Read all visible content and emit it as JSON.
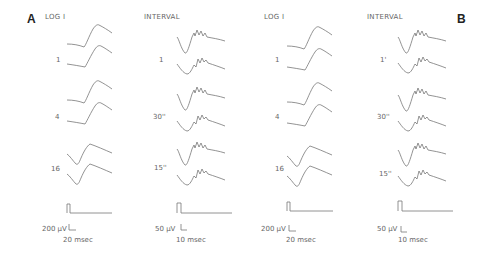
{
  "figure": {
    "panels": [
      {
        "id": "A",
        "letter": "A",
        "columns": [
          {
            "header": "LOG I",
            "rows": [
              {
                "label": "1"
              },
              {
                "label": "4"
              },
              {
                "label": "16"
              }
            ],
            "scale": {
              "amplitude": "200 µV",
              "time": "20 msec"
            }
          },
          {
            "header": "INTERVAL",
            "rows": [
              {
                "label": "1"
              },
              {
                "label": "30''"
              },
              {
                "label": "15''"
              }
            ],
            "scale": {
              "amplitude": "50 µV",
              "time": "10 msec"
            }
          }
        ]
      },
      {
        "id": "B",
        "letter": "B",
        "columns": [
          {
            "header": "LOG I",
            "rows": [
              {
                "label": "1"
              },
              {
                "label": "4"
              },
              {
                "label": "16"
              }
            ],
            "scale": {
              "amplitude": "200 µV",
              "time": "20 msec"
            }
          },
          {
            "header": "INTERVAL",
            "rows": [
              {
                "label": "1'"
              },
              {
                "label": "30''"
              },
              {
                "label": "15''"
              }
            ],
            "scale": {
              "amplitude": "50 µV",
              "time": "10 msec"
            }
          }
        ]
      }
    ],
    "trace_color": "#777777",
    "background": "#ffffff"
  }
}
